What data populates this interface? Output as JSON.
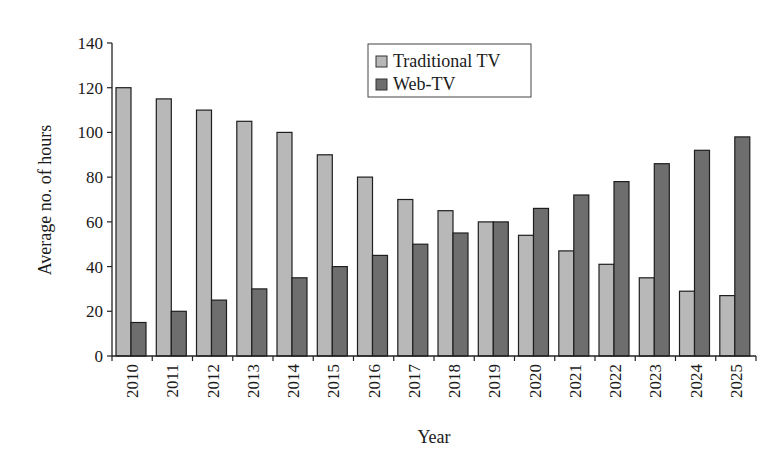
{
  "chart_data": {
    "type": "bar",
    "title": "",
    "xlabel": "Year",
    "ylabel": "Average no. of hours",
    "ylim": [
      0,
      140
    ],
    "yticks": [
      0,
      20,
      40,
      60,
      80,
      100,
      120,
      140
    ],
    "grid": false,
    "legend_position": "top-center",
    "categories": [
      "2010",
      "2011",
      "2012",
      "2013",
      "2014",
      "2015",
      "2016",
      "2017",
      "2018",
      "2019",
      "2020",
      "2021",
      "2022",
      "2023",
      "2024",
      "2025"
    ],
    "series": [
      {
        "name": "Traditional TV",
        "color": "#b8b8b8",
        "values": [
          120,
          115,
          110,
          105,
          100,
          90,
          80,
          70,
          65,
          60,
          54,
          47,
          41,
          35,
          29,
          27
        ]
      },
      {
        "name": "Web-TV",
        "color": "#6e6e6e",
        "values": [
          15,
          20,
          25,
          30,
          35,
          40,
          45,
          50,
          55,
          60,
          66,
          72,
          78,
          86,
          92,
          98
        ]
      }
    ]
  },
  "legend": {
    "items": [
      {
        "label": "Traditional TV",
        "color": "#b8b8b8"
      },
      {
        "label": "Web-TV",
        "color": "#6e6e6e"
      }
    ]
  }
}
